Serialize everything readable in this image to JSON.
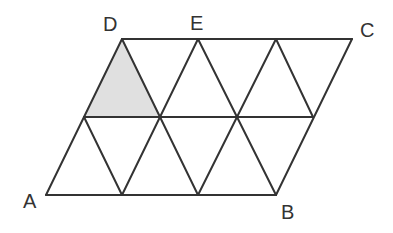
{
  "diagram": {
    "type": "parallelogram subdivided into equilateral triangles",
    "colors": {
      "stroke": "#333333",
      "shade": "#e0e0e0",
      "background": "#ffffff"
    },
    "labels": {
      "A": "A",
      "B": "B",
      "C": "C",
      "D": "D",
      "E": "E"
    },
    "rows": 2,
    "columns": 3,
    "shaded_triangle": "upper-left triangle with apex at D"
  }
}
